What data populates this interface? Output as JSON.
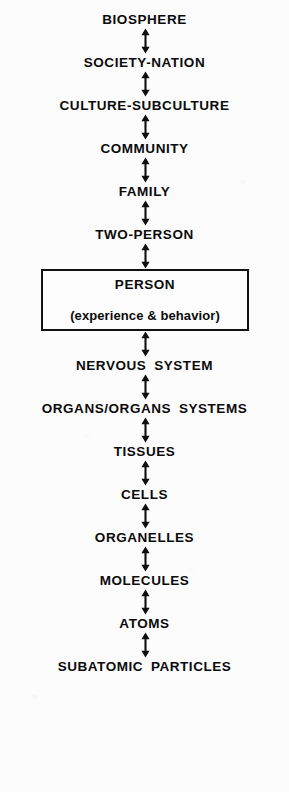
{
  "figure": {
    "orientation": "vertical",
    "arrow_style": "double-headed",
    "arrow_count": 14,
    "text_color": "#0b0b0b",
    "background_color": "#fcfcfc",
    "box_border_color": "#111111",
    "arrow_icon_name": "double-headed-vertical-arrow-icon"
  },
  "levels": [
    {
      "label": "BIOSPHERE",
      "type": "text"
    },
    {
      "label": "SOCIETY-NATION",
      "type": "text"
    },
    {
      "label": "CULTURE-SUBCULTURE",
      "type": "text"
    },
    {
      "label": "COMMUNITY",
      "type": "text"
    },
    {
      "label": "FAMILY",
      "type": "text"
    },
    {
      "label": "TWO-PERSON",
      "type": "text"
    },
    {
      "label": "PERSON",
      "type": "box",
      "sublabel": "(experience & behavior)"
    },
    {
      "label": "NERVOUS SYSTEM",
      "type": "text"
    },
    {
      "label": "ORGANS/ORGANS SYSTEMS",
      "type": "text"
    },
    {
      "label": "TISSUES",
      "type": "text"
    },
    {
      "label": "CELLS",
      "type": "text"
    },
    {
      "label": "ORGANELLES",
      "type": "text"
    },
    {
      "label": "MOLECULES",
      "type": "text"
    },
    {
      "label": "ATOMS",
      "type": "text"
    },
    {
      "label": "SUBATOMIC PARTICLES",
      "type": "text"
    }
  ]
}
